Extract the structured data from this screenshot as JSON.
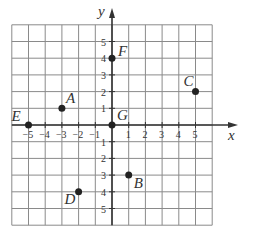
{
  "chart_data": {
    "type": "scatter",
    "title": "",
    "xlabel": "x",
    "ylabel": "y",
    "xlim": [
      -6,
      6
    ],
    "ylim": [
      -6,
      6
    ],
    "grid": true,
    "x_ticks": [
      -5,
      -4,
      -3,
      -2,
      -1,
      1,
      2,
      3,
      4,
      5
    ],
    "y_ticks": [
      -5,
      -4,
      -3,
      -2,
      -1,
      1,
      2,
      3,
      4,
      5
    ],
    "points": [
      {
        "label": "A",
        "x": -3,
        "y": 1
      },
      {
        "label": "B",
        "x": 1,
        "y": -3
      },
      {
        "label": "C",
        "x": 5,
        "y": 2
      },
      {
        "label": "D",
        "x": -2,
        "y": -4
      },
      {
        "label": "E",
        "x": -5,
        "y": 0
      },
      {
        "label": "F",
        "x": 0,
        "y": 4
      },
      {
        "label": "G",
        "x": 0,
        "y": 0
      }
    ]
  },
  "colors": {
    "grid": "#8a8a8a",
    "axis": "#333333",
    "point": "#222222"
  }
}
